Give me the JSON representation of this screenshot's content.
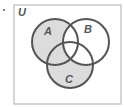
{
  "diagram": {
    "type": "venn",
    "universe_label": "U",
    "sets": [
      {
        "label": "A",
        "cx": 55,
        "cy": 42,
        "r": 23
      },
      {
        "label": "B",
        "cx": 86,
        "cy": 42,
        "r": 23
      },
      {
        "label": "C",
        "cx": 70,
        "cy": 65,
        "r": 23
      }
    ],
    "shaded_regions": [
      "A only",
      "C only",
      "A∩C only"
    ],
    "unshaded_regions": [
      "B only",
      "A∩B only",
      "B∩C only",
      "A∩B∩C"
    ],
    "shaded_expression": "(A ∪ C) − B",
    "colors": {
      "shade": "#dcdcdc",
      "stroke": "#555555",
      "frame": "#bbbbbb",
      "background": "#ffffff"
    }
  }
}
